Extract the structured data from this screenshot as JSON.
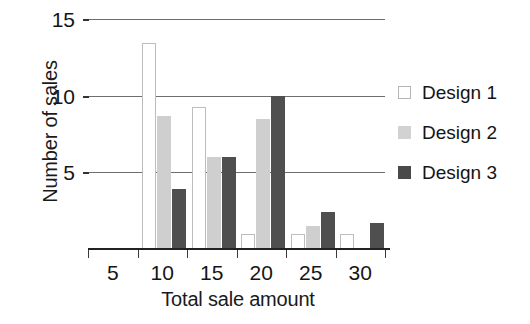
{
  "chart_data": {
    "type": "bar",
    "title": "",
    "xlabel": "Total sale amount",
    "ylabel": "Number of sales",
    "categories": [
      "5",
      "10",
      "15",
      "20",
      "25",
      "30"
    ],
    "series": [
      {
        "name": "Design 1",
        "color": "#ffffff",
        "values": [
          0,
          13.5,
          9.3,
          1.0,
          1.0,
          1.0
        ]
      },
      {
        "name": "Design 2",
        "color": "#cfcfcf",
        "values": [
          0,
          8.7,
          6.0,
          8.5,
          1.5,
          0
        ]
      },
      {
        "name": "Design 3",
        "color": "#4f4f4f",
        "values": [
          0,
          3.9,
          6.0,
          10.0,
          2.4,
          1.7
        ]
      }
    ],
    "ylim": [
      0,
      15
    ],
    "yticks": [
      5,
      10,
      15
    ],
    "ytick_labels": [
      "5",
      "10",
      "15"
    ],
    "xtick_labels": [
      "5",
      "10",
      "15",
      "20",
      "25",
      "30"
    ],
    "grid": true,
    "grid_axis": "y",
    "legend_position": "right"
  },
  "legend": {
    "items": [
      {
        "label": "Design 1",
        "swatch": "legend-swatch-design-1"
      },
      {
        "label": "Design 2",
        "swatch": "legend-swatch-design-2"
      },
      {
        "label": "Design 3",
        "swatch": "legend-swatch-design-3"
      }
    ]
  },
  "axes": {
    "y_title": "Number of sales",
    "x_title": "Total sale amount",
    "y_ticks": [
      "15",
      "10",
      "5"
    ],
    "x_ticks": [
      "5",
      "10",
      "15",
      "20",
      "25",
      "30"
    ]
  }
}
